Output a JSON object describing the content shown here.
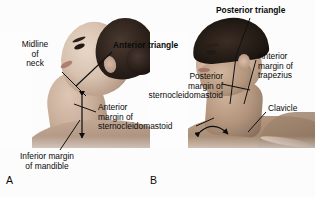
{
  "figure": {
    "panels": [
      {
        "letter": "A",
        "subject": "female-head-tilted-back",
        "description": "Anterolateral view of a woman's neck with the head turned and tilted back"
      },
      {
        "letter": "B",
        "subject": "male-profile",
        "description": "Lateral view of a man's neck showing the posterior triangle"
      }
    ]
  },
  "labels": {
    "midline_of_neck": "Midline\nof\nneck",
    "inferior_margin_of_mandible": "Inferior margin\nof mandible",
    "anterior_triangle": "Anterior triangle",
    "posterior_margin_of_sternocleidomastoid": "Posterior\nmargin of\nsternocleidomastoid",
    "anterior_margin_of_sternocleidomastoid": "Anterior\nmargin of\nsternocleidomastoid",
    "posterior_triangle": "Posterior triangle",
    "anterior_margin_of_trapezius": "Anterior\nmargin of\ntrapezius",
    "clavicle": "Clavicle"
  },
  "panel_letters": {
    "a": "A",
    "b": "B"
  },
  "colors": {
    "background": "#fdfdfd",
    "text": "#0b0b0b",
    "leader_line": "#111111",
    "arrow": "#0d0d0d"
  }
}
